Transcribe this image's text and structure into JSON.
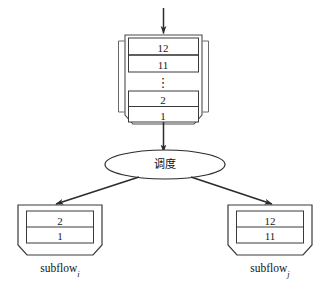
{
  "diagram": {
    "type": "scheduling-flow",
    "stroke_color": "#2b2b2b",
    "text_color": "#1a1a1a",
    "background": "#ffffff",
    "input_arrow": {
      "name": "input-arrow",
      "direction": "down"
    },
    "main_queue": {
      "label": "main-queue",
      "top_group": [
        "12",
        "11"
      ],
      "ellipsis": "⋮",
      "bottom_group": [
        "2",
        "1"
      ]
    },
    "scheduler": {
      "label": "调度",
      "shape": "ellipse"
    },
    "queue_to_scheduler_arrow": {
      "name": "queue-to-scheduler-arrow",
      "direction": "down"
    },
    "subflows": [
      {
        "id": "subflow-i",
        "name": "subflow",
        "subscript": "i",
        "items": [
          "2",
          "1"
        ],
        "arrow_name": "scheduler-to-subflow-i-arrow"
      },
      {
        "id": "subflow-j",
        "name": "subflow",
        "subscript": "j",
        "items": [
          "12",
          "11"
        ],
        "arrow_name": "scheduler-to-subflow-j-arrow"
      }
    ]
  }
}
